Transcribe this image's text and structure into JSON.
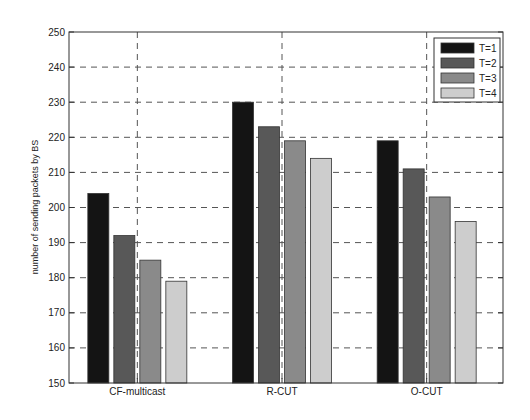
{
  "chart_data": {
    "type": "bar",
    "title": "",
    "xlabel": "",
    "ylabel": "number of sending packets by BS",
    "ylim": [
      150,
      250
    ],
    "yticks": [
      150,
      160,
      170,
      180,
      190,
      200,
      210,
      220,
      230,
      240,
      250
    ],
    "categories": [
      "CF-multicast",
      "R-CUT",
      "O-CUT"
    ],
    "series": [
      {
        "name": "T=1",
        "color": "#141414",
        "values": [
          204,
          230,
          219
        ]
      },
      {
        "name": "T=2",
        "color": "#585858",
        "values": [
          192,
          223,
          211
        ]
      },
      {
        "name": "T=3",
        "color": "#8a8a8a",
        "values": [
          185,
          219,
          203
        ]
      },
      {
        "name": "T=4",
        "color": "#cdcdcd",
        "values": [
          179,
          214,
          196
        ]
      }
    ],
    "grid": true,
    "legend_position": "upper right"
  }
}
